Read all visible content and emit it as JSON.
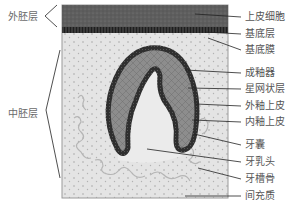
{
  "figure": {
    "left_labels": [
      {
        "id": "ectoderm",
        "text": "外胚层",
        "x": 8,
        "y": 11
      },
      {
        "id": "mesoderm",
        "text": "中胚层",
        "x": 8,
        "y": 108
      }
    ],
    "right_labels": [
      {
        "id": "epithelial-cells",
        "text": "上皮细胞",
        "x": 245,
        "y": 11
      },
      {
        "id": "basal-layer",
        "text": "基底层",
        "x": 245,
        "y": 28
      },
      {
        "id": "basement-membrane",
        "text": "基底膜",
        "x": 245,
        "y": 44
      },
      {
        "id": "enamel-organ",
        "text": "成釉器",
        "x": 245,
        "y": 67
      },
      {
        "id": "stellate-reticulum",
        "text": "星网状层",
        "x": 245,
        "y": 83
      },
      {
        "id": "outer-enamel-epithelium",
        "text": "外釉上皮",
        "x": 245,
        "y": 100
      },
      {
        "id": "inner-enamel-epithelium",
        "text": "内釉上皮",
        "x": 245,
        "y": 116
      },
      {
        "id": "dental-follicle",
        "text": "牙囊",
        "x": 245,
        "y": 139
      },
      {
        "id": "dental-papilla",
        "text": "牙乳头",
        "x": 245,
        "y": 156
      },
      {
        "id": "alveolar-bone",
        "text": "牙槽骨",
        "x": 245,
        "y": 173
      },
      {
        "id": "mesenchyme",
        "text": "间充质",
        "x": 245,
        "y": 190
      }
    ],
    "colors": {
      "epithelium": "#5e5e5e",
      "basal_layer": "#2e2e2e",
      "mesenchyme": "#e4e4e4",
      "enamel_organ": "#8a8a8a",
      "enamel_rim": "#333333",
      "papilla": "#e9e9e9",
      "leader_line": "#222222",
      "label_text": "#555555"
    }
  }
}
